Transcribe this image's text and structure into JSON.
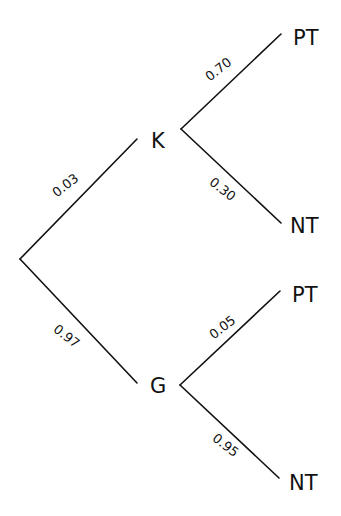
{
  "diagram": {
    "type": "probability-tree",
    "root": {
      "x": 20,
      "y": 259
    },
    "nodes": [
      {
        "id": "K",
        "label": "K",
        "x": 158,
        "y": 147,
        "in_x": 137,
        "in_y": 139,
        "out_x": 181,
        "out_y": 129
      },
      {
        "id": "G",
        "label": "G",
        "x": 158,
        "y": 392,
        "in_x": 137,
        "in_y": 383,
        "out_x": 180,
        "out_y": 385
      },
      {
        "id": "K-PT",
        "label": "PT",
        "x": 293,
        "y": 44,
        "in_x": 281,
        "in_y": 34
      },
      {
        "id": "K-NT",
        "label": "NT",
        "x": 290,
        "y": 232,
        "in_x": 281,
        "in_y": 223
      },
      {
        "id": "G-PT",
        "label": "PT",
        "x": 292,
        "y": 301,
        "in_x": 280,
        "in_y": 291
      },
      {
        "id": "G-NT",
        "label": "NT",
        "x": 289,
        "y": 489,
        "in_x": 279,
        "in_y": 478
      }
    ],
    "edges": [
      {
        "from": "root",
        "to": "K",
        "probability": "0.03",
        "label_x": 66,
        "label_y": 186,
        "angle": -38
      },
      {
        "from": "root",
        "to": "G",
        "probability": "0.97",
        "label_x": 66,
        "label_y": 337,
        "angle": 38
      },
      {
        "from": "K",
        "to": "K-PT",
        "probability": "0.70",
        "label_x": 219,
        "label_y": 70,
        "angle": -38
      },
      {
        "from": "K",
        "to": "K-NT",
        "probability": "0.30",
        "label_x": 222,
        "label_y": 190,
        "angle": 38
      },
      {
        "from": "G",
        "to": "G-PT",
        "probability": "0.05",
        "label_x": 223,
        "label_y": 328,
        "angle": -38
      },
      {
        "from": "G",
        "to": "G-NT",
        "probability": "0.95",
        "label_x": 225,
        "label_y": 446,
        "angle": 38
      }
    ]
  },
  "labels": {
    "k": "K",
    "g": "G",
    "k_pt": "PT",
    "k_nt": "NT",
    "g_pt": "PT",
    "g_nt": "NT",
    "p_root_k": "0.03",
    "p_root_g": "0.97",
    "p_k_pt": "0.70",
    "p_k_nt": "0.30",
    "p_g_pt": "0.05",
    "p_g_nt": "0.95"
  },
  "colors": {
    "line": "#111111",
    "text": "#111111",
    "background": "#ffffff"
  }
}
